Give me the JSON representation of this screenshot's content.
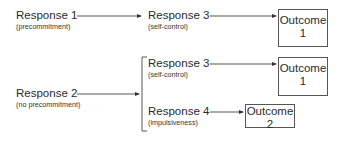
{
  "diagram": {
    "row1": {
      "response_1": {
        "label": "Response 1",
        "sub": "(precommitment)"
      },
      "response_3": {
        "label": "Response 3",
        "sub": "(self-control)"
      },
      "outcome": {
        "line1": "Outcome",
        "line2": "1"
      }
    },
    "row2": {
      "response_2": {
        "label": "Response 2",
        "sub": "(no precommitment)"
      },
      "branch_a": {
        "response_3": {
          "label": "Response 3",
          "sub": "(self-control)"
        },
        "outcome": {
          "line1": "Outcome",
          "line2": "1"
        }
      },
      "branch_b": {
        "response_4": {
          "label": "Response 4",
          "sub": "(impulsiveness)"
        },
        "outcome": {
          "line1": "Outcome",
          "line2": "2"
        }
      }
    },
    "colors": {
      "line": "#444444",
      "text": "#2a2a2a"
    }
  }
}
